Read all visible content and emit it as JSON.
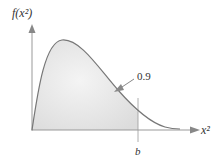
{
  "diagram": {
    "y_axis_label": "f(x²)",
    "x_axis_label": "x²",
    "area_label": "0.9",
    "cutoff_label": "b",
    "colors": {
      "curve": "#777777",
      "axis": "#999999",
      "shade": "#e2e2e2",
      "arrow": "#888888"
    }
  }
}
